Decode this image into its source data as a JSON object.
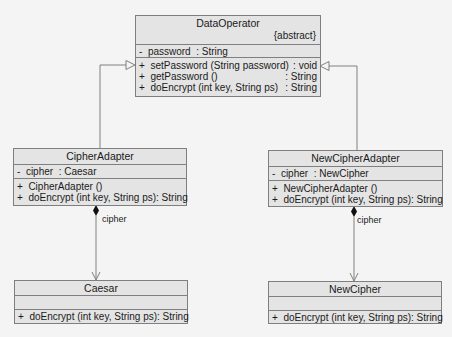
{
  "classes": {
    "data_operator": {
      "name": "DataOperator",
      "stereotype": "{abstract}",
      "attributes": [
        {
          "text": "-  password  : String",
          "type": ""
        }
      ],
      "operations": [
        {
          "sig": "+  setPassword (String password)",
          "ret": ": void"
        },
        {
          "sig": "+  getPassword ()",
          "ret": ": String"
        },
        {
          "sig": "+  doEncrypt (int key, String ps)",
          "ret": ": String"
        }
      ]
    },
    "cipher_adapter": {
      "name": "CipherAdapter",
      "attributes": [
        {
          "text": "-  cipher  : Caesar"
        }
      ],
      "operations": [
        {
          "sig": "+  CipherAdapter ()",
          "ret": ""
        },
        {
          "sig": "+  doEncrypt (int key, String ps)",
          "ret": ": String"
        }
      ]
    },
    "new_cipher_adapter": {
      "name": "NewCipherAdapter",
      "attributes": [
        {
          "text": "-  cipher  : NewCipher"
        }
      ],
      "operations": [
        {
          "sig": "+  NewCipherAdapter ()",
          "ret": ""
        },
        {
          "sig": "+  doEncrypt (int key, String ps)",
          "ret": ": String"
        }
      ]
    },
    "caesar": {
      "name": "Caesar",
      "attributes": [],
      "operations": [
        {
          "sig": "+  doEncrypt (int key, String ps)",
          "ret": ": String"
        }
      ]
    },
    "new_cipher": {
      "name": "NewCipher",
      "attributes": [],
      "operations": [
        {
          "sig": "+  doEncrypt (int key, String ps)",
          "ret": ": String"
        }
      ]
    }
  },
  "relationships": {
    "left_composition_label": "cipher",
    "right_composition_label": "cipher"
  },
  "colors": {
    "box_fill": "#e4e4e4",
    "box_border": "#7f7f7f",
    "line": "#808080",
    "background": "#f4f4f4"
  }
}
